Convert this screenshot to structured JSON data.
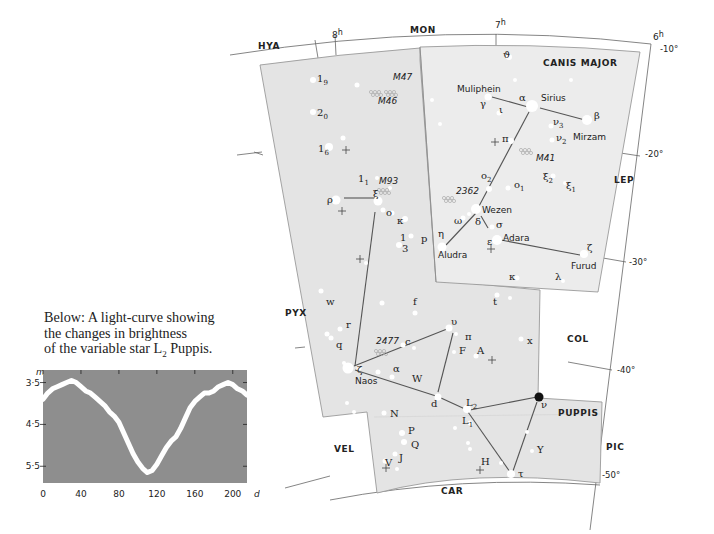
{
  "caption": {
    "line1": "Below: A light-curve showing",
    "line2": "the changes in brightness",
    "line3_pre": "of the variable star L",
    "line3_sub": "2",
    "line3_post": " Puppis."
  },
  "chart_data": {
    "type": "line",
    "xlabel": "d",
    "ylabel": "m",
    "x_ticks": [
      0,
      40,
      80,
      120,
      160,
      200
    ],
    "y_ticks": [
      "3·5",
      "4·5",
      "5·5"
    ],
    "xlim": [
      0,
      215
    ],
    "ylim": [
      5.9,
      3.2
    ],
    "y_inverted": true,
    "grid": false,
    "background": "#8e8e8e",
    "line_color": "#ffffff",
    "x": [
      0,
      5,
      10,
      15,
      20,
      25,
      30,
      35,
      40,
      45,
      50,
      55,
      60,
      65,
      70,
      75,
      80,
      85,
      90,
      95,
      100,
      105,
      110,
      115,
      120,
      125,
      130,
      135,
      140,
      145,
      150,
      155,
      160,
      165,
      170,
      175,
      180,
      185,
      190,
      195,
      200,
      205,
      210,
      215
    ],
    "values": [
      3.9,
      3.75,
      3.65,
      3.6,
      3.55,
      3.5,
      3.45,
      3.5,
      3.6,
      3.7,
      3.75,
      3.85,
      3.95,
      4.05,
      4.2,
      4.3,
      4.45,
      4.7,
      4.95,
      5.2,
      5.4,
      5.55,
      5.65,
      5.6,
      5.45,
      5.25,
      5.05,
      4.9,
      4.8,
      4.6,
      4.35,
      4.1,
      3.95,
      3.85,
      3.75,
      3.75,
      3.7,
      3.6,
      3.55,
      3.5,
      3.55,
      3.65,
      3.7,
      3.8
    ]
  },
  "map": {
    "constellation_title": "PUPPIS",
    "neighbor_labels": [
      {
        "text": "HYA",
        "x": 258,
        "y": 49
      },
      {
        "text": "MON",
        "x": 410,
        "y": 33
      },
      {
        "text": "CANIS MAJOR",
        "x": 543,
        "y": 66
      },
      {
        "text": "LEP",
        "x": 614,
        "y": 183
      },
      {
        "text": "PYX",
        "x": 285,
        "y": 316
      },
      {
        "text": "COL",
        "x": 567,
        "y": 342
      },
      {
        "text": "PUPPIS",
        "x": 558,
        "y": 416
      },
      {
        "text": "VEL",
        "x": 334,
        "y": 452
      },
      {
        "text": "PIC",
        "x": 606,
        "y": 450
      },
      {
        "text": "CAR",
        "x": 441,
        "y": 494
      }
    ],
    "ra_labels": [
      {
        "text": "8h",
        "x": 332,
        "y": 38
      },
      {
        "text": "7h",
        "x": 495,
        "y": 28
      },
      {
        "text": "6h",
        "x": 653,
        "y": 40
      }
    ],
    "dec_labels": [
      {
        "text": "-10°",
        "x": 660,
        "y": 52
      },
      {
        "text": "-20°",
        "x": 645,
        "y": 157
      },
      {
        "text": "-30°",
        "x": 629,
        "y": 265
      },
      {
        "text": "-40°",
        "x": 617,
        "y": 373
      },
      {
        "text": "-50°",
        "x": 602,
        "y": 478
      }
    ],
    "clusters": [
      {
        "text": "M47",
        "x": 393,
        "y": 80
      },
      {
        "text": "M46",
        "x": 378,
        "y": 104
      },
      {
        "text": "M93",
        "x": 379,
        "y": 184
      },
      {
        "text": "M41",
        "x": 536,
        "y": 161
      },
      {
        "text": "2362",
        "x": 456,
        "y": 194
      },
      {
        "text": "2477",
        "x": 376,
        "y": 344
      }
    ],
    "star_names": [
      {
        "text": "Muliphein",
        "x": 457,
        "y": 92
      },
      {
        "text": "Sirius",
        "x": 541,
        "y": 101
      },
      {
        "text": "Mirzam",
        "x": 573,
        "y": 140
      },
      {
        "text": "Wezen",
        "x": 482,
        "y": 213
      },
      {
        "text": "Aludra",
        "x": 438,
        "y": 258
      },
      {
        "text": "Adara",
        "x": 503,
        "y": 241
      },
      {
        "text": "Furud",
        "x": 571,
        "y": 269
      },
      {
        "text": "Naos",
        "x": 355,
        "y": 384
      }
    ],
    "greek_labels": [
      {
        "text": "ϑ",
        "x": 503,
        "y": 58
      },
      {
        "text": "α",
        "x": 519,
        "y": 101
      },
      {
        "text": "γ",
        "x": 480,
        "y": 107
      },
      {
        "text": "ι",
        "x": 499,
        "y": 113
      },
      {
        "text": "β",
        "x": 594,
        "y": 119
      },
      {
        "text": "ν3",
        "x": 553,
        "y": 125
      },
      {
        "text": "ν2",
        "x": 556,
        "y": 141
      },
      {
        "text": "π",
        "x": 502,
        "y": 142
      },
      {
        "text": "ξ2",
        "x": 543,
        "y": 180
      },
      {
        "text": "ξ1",
        "x": 566,
        "y": 189
      },
      {
        "text": "o2",
        "x": 481,
        "y": 179
      },
      {
        "text": "o1",
        "x": 514,
        "y": 188
      },
      {
        "text": "ω",
        "x": 454,
        "y": 224
      },
      {
        "text": "δ",
        "x": 475,
        "y": 225
      },
      {
        "text": "σ",
        "x": 496,
        "y": 228
      },
      {
        "text": "η",
        "x": 438,
        "y": 237
      },
      {
        "text": "ε",
        "x": 487,
        "y": 245
      },
      {
        "text": "ζ",
        "x": 587,
        "y": 251
      },
      {
        "text": "κ",
        "x": 509,
        "y": 280
      },
      {
        "text": "λ",
        "x": 555,
        "y": 280
      },
      {
        "text": "ξ",
        "x": 373,
        "y": 197
      },
      {
        "text": "ρ",
        "x": 327,
        "y": 203
      },
      {
        "text": "o",
        "x": 386,
        "y": 216
      },
      {
        "text": "κ",
        "x": 397,
        "y": 224
      },
      {
        "text": "1",
        "x": 400,
        "y": 241
      },
      {
        "text": "3",
        "x": 402,
        "y": 252
      },
      {
        "text": "p",
        "x": 421,
        "y": 242
      },
      {
        "text": "19",
        "x": 317,
        "y": 82
      },
      {
        "text": "20",
        "x": 317,
        "y": 116
      },
      {
        "text": "16",
        "x": 318,
        "y": 152
      },
      {
        "text": "11",
        "x": 358,
        "y": 182
      },
      {
        "text": "w",
        "x": 326,
        "y": 305
      },
      {
        "text": "r",
        "x": 346,
        "y": 328
      },
      {
        "text": "q",
        "x": 336,
        "y": 348
      },
      {
        "text": "f",
        "x": 413,
        "y": 305
      },
      {
        "text": "t",
        "x": 493,
        "y": 305
      },
      {
        "text": "υ",
        "x": 451,
        "y": 325
      },
      {
        "text": "π",
        "x": 465,
        "y": 340
      },
      {
        "text": "c",
        "x": 405,
        "y": 345
      },
      {
        "text": "F",
        "x": 459,
        "y": 354
      },
      {
        "text": "A",
        "x": 477,
        "y": 354
      },
      {
        "text": "x",
        "x": 527,
        "y": 344
      },
      {
        "text": "ζ",
        "x": 357,
        "y": 373
      },
      {
        "text": "α",
        "x": 393,
        "y": 372
      },
      {
        "text": "W",
        "x": 412,
        "y": 382
      },
      {
        "text": "d",
        "x": 431,
        "y": 407
      },
      {
        "text": "L2",
        "x": 466,
        "y": 406
      },
      {
        "text": "L1",
        "x": 462,
        "y": 424
      },
      {
        "text": "ν",
        "x": 541,
        "y": 408
      },
      {
        "text": "N",
        "x": 390,
        "y": 417
      },
      {
        "text": "P",
        "x": 408,
        "y": 434
      },
      {
        "text": "Q",
        "x": 411,
        "y": 448
      },
      {
        "text": "J",
        "x": 399,
        "y": 461
      },
      {
        "text": "V",
        "x": 385,
        "y": 466
      },
      {
        "text": "H",
        "x": 481,
        "y": 465
      },
      {
        "text": "Y",
        "x": 537,
        "y": 453
      },
      {
        "text": "τ",
        "x": 518,
        "y": 477
      }
    ],
    "stars": [
      [
        509,
        57,
        3
      ],
      [
        488,
        97,
        3.5
      ],
      [
        532,
        106,
        6
      ],
      [
        587,
        120,
        5
      ],
      [
        499,
        113,
        2.5
      ],
      [
        551,
        126,
        2.5
      ],
      [
        552,
        140,
        2.5
      ],
      [
        511,
        141,
        3
      ],
      [
        553,
        176,
        2.5
      ],
      [
        565,
        183,
        2
      ],
      [
        489,
        189,
        3
      ],
      [
        508,
        188,
        2.5
      ],
      [
        476,
        209,
        5
      ],
      [
        463,
        218,
        2.5
      ],
      [
        469,
        214,
        2
      ],
      [
        492,
        227,
        2.5
      ],
      [
        442,
        247,
        4.5
      ],
      [
        497,
        240,
        5
      ],
      [
        584,
        254,
        4
      ],
      [
        517,
        278,
        2.5
      ],
      [
        563,
        281,
        2
      ],
      [
        515,
        80,
        2
      ],
      [
        571,
        80,
        2
      ],
      [
        432,
        100,
        2
      ],
      [
        440,
        124,
        2
      ],
      [
        357,
        85,
        2.5
      ],
      [
        313,
        80,
        3
      ],
      [
        313,
        112,
        3
      ],
      [
        329,
        147,
        4
      ],
      [
        343,
        138,
        2.5
      ],
      [
        336,
        200,
        4.5
      ],
      [
        378,
        201,
        4.5
      ],
      [
        383,
        210,
        2.5
      ],
      [
        392,
        213,
        2.5
      ],
      [
        405,
        219,
        3
      ],
      [
        399,
        245,
        3
      ],
      [
        411,
        236,
        2.5
      ],
      [
        377,
        178,
        2
      ],
      [
        390,
        188,
        2
      ],
      [
        366,
        263,
        2
      ],
      [
        321,
        291,
        2.5
      ],
      [
        340,
        329,
        2.5
      ],
      [
        327,
        334,
        2.5
      ],
      [
        331,
        338,
        2.5
      ],
      [
        382,
        303,
        2.5
      ],
      [
        415,
        313,
        2.5
      ],
      [
        497,
        295,
        2.5
      ],
      [
        510,
        298,
        2
      ],
      [
        449,
        328,
        3.5
      ],
      [
        456,
        334,
        2
      ],
      [
        454,
        352,
        2
      ],
      [
        476,
        356,
        2.5
      ],
      [
        521,
        339,
        2.5
      ],
      [
        403,
        345,
        2.5
      ],
      [
        414,
        348,
        2
      ],
      [
        348,
        368,
        5.5
      ],
      [
        359,
        368,
        2.5
      ],
      [
        344,
        363,
        2
      ],
      [
        378,
        372,
        2.5
      ],
      [
        392,
        377,
        2.5
      ],
      [
        438,
        397,
        3.5
      ],
      [
        467,
        409,
        4
      ],
      [
        470,
        423,
        2.5
      ],
      [
        468,
        443,
        2
      ],
      [
        470,
        449,
        2
      ],
      [
        511,
        474,
        4
      ],
      [
        527,
        432,
        2
      ],
      [
        532,
        451,
        2
      ],
      [
        501,
        463,
        2
      ],
      [
        384,
        413,
        2.5
      ],
      [
        402,
        433,
        3
      ],
      [
        404,
        442,
        3
      ],
      [
        395,
        454,
        2.5
      ],
      [
        385,
        461,
        2.5
      ],
      [
        397,
        469,
        2
      ],
      [
        455,
        428,
        2
      ],
      [
        354,
        412,
        2
      ],
      [
        347,
        403,
        2
      ]
    ],
    "highlight_star": {
      "label": "ν",
      "x": 539,
      "y": 397,
      "r": 4.5,
      "color": "#111111"
    },
    "crosses": [
      [
        346,
        150
      ],
      [
        360,
        259
      ],
      [
        495,
        142
      ],
      [
        491,
        249
      ],
      [
        342,
        211
      ],
      [
        492,
        360
      ],
      [
        386,
        468
      ],
      [
        480,
        470
      ]
    ],
    "stick_lines": [
      [
        [
          492,
          97
        ],
        [
          528,
          107
        ]
      ],
      [
        [
          540,
          108
        ],
        [
          585,
          120
        ]
      ],
      [
        [
          529,
          112
        ],
        [
          478,
          208
        ]
      ],
      [
        [
          476,
          213
        ],
        [
          446,
          245
        ]
      ],
      [
        [
          481,
          216
        ],
        [
          488,
          228
        ]
      ],
      [
        [
          501,
          240
        ],
        [
          580,
          255
        ]
      ],
      [
        [
          344,
          198
        ],
        [
          375,
          198
        ]
      ],
      [
        [
          375,
          212
        ],
        [
          355,
          366
        ]
      ],
      [
        [
          354,
          366
        ],
        [
          447,
          329
        ]
      ],
      [
        [
          355,
          370
        ],
        [
          436,
          396
        ]
      ],
      [
        [
          453,
          333
        ],
        [
          438,
          392
        ]
      ],
      [
        [
          441,
          398
        ],
        [
          465,
          409
        ]
      ],
      [
        [
          470,
          410
        ],
        [
          537,
          397
        ]
      ],
      [
        [
          468,
          412
        ],
        [
          510,
          472
        ]
      ],
      [
        [
          537,
          402
        ],
        [
          513,
          471
        ]
      ]
    ]
  }
}
